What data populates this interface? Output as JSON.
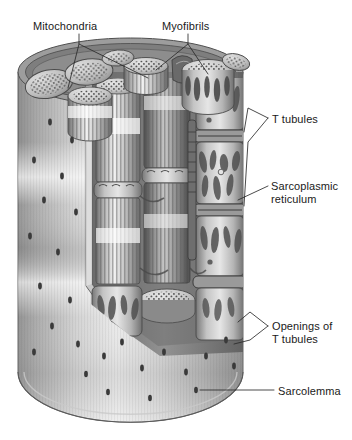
{
  "figure": {
    "background_color": "#ffffff",
    "ink_color": "#1a1a1a",
    "width": 352,
    "height": 440
  },
  "labels": [
    {
      "id": "mitochondria",
      "name": "label-mitochondria",
      "text": "Mitochondria",
      "x": 33,
      "y": 20,
      "leaders": 2
    },
    {
      "id": "myofibrils",
      "name": "label-myofibrils",
      "text": "Myofibrils",
      "x": 162,
      "y": 20,
      "leaders": 2
    },
    {
      "id": "t-tubules",
      "name": "label-t-tubules",
      "text": "T tubules",
      "x": 272,
      "y": 113,
      "leaders": 2
    },
    {
      "id": "sarcoplasmic-reticulum",
      "name": "label-sarcoplasmic-reticulum",
      "text": "Sarcoplasmic",
      "text2": "reticulum",
      "x": 271,
      "y": 180,
      "leaders": 1
    },
    {
      "id": "openings-of-t-tubules",
      "name": "label-openings-of-t-tubules",
      "text": "Openings of",
      "text2": "T tubules",
      "x": 272,
      "y": 320,
      "leaders": 2
    },
    {
      "id": "sarcolemma",
      "name": "label-sarcolemma",
      "text": "Sarcolemma",
      "x": 278,
      "y": 385,
      "leaders": 1
    }
  ],
  "structures": {
    "sarcolemma": {
      "label": "Sarcolemma",
      "description": "outer cell membrane of the muscle fiber",
      "shape": "cylinder",
      "tone_light": "#f2f2f2",
      "tone_mid": "#b8b8b8",
      "tone_dark": "#6e6e6e"
    },
    "myofibril": {
      "label": "Myofibrils",
      "description": "striated contractile rods running the length of the fiber",
      "striation_color": "#5a5a5a",
      "count_visible": 5
    },
    "mitochondria": {
      "label": "Mitochondria",
      "description": "stippled oval organelles between myofibrils",
      "stipple_color": "#4a4a4a",
      "count_visible": 6
    },
    "sarcoplasmic_reticulum": {
      "label": "Sarcoplasmic reticulum",
      "description": "lobed membranous network sleeving each myofibril",
      "lobe_color": "#4f4f4f"
    },
    "t_tubules": {
      "label": "T tubules",
      "description": "transverse invaginations of the sarcolemma",
      "ring_color": "#3c3c3c"
    },
    "t_tubule_openings": {
      "label": "Openings of T tubules",
      "description": "dark pores dotting the sarcolemma surface",
      "dot_color": "#3a3a3a",
      "count_visible": 26
    }
  }
}
